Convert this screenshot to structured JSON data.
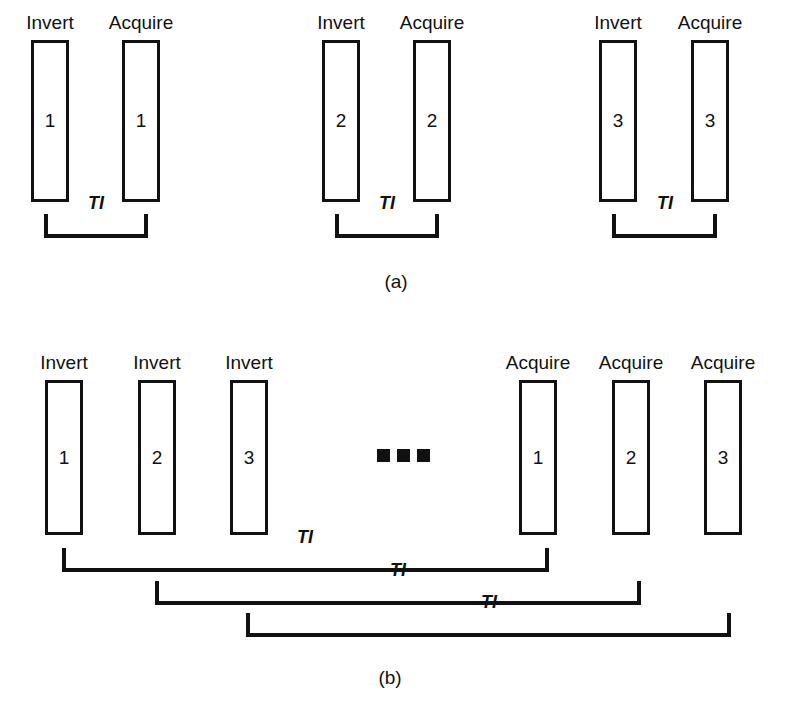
{
  "figure": {
    "ti_label": "TI",
    "panels": [
      {
        "caption": "(a)",
        "caption_x": 396,
        "caption_y": 272,
        "groups": [
          {
            "invert": {
              "label": "Invert",
              "number": "1",
              "x": 31,
              "y": 40,
              "w": 38,
              "h": 162
            },
            "acquire": {
              "label": "Acquire",
              "number": "1",
              "x": 122,
              "y": 40,
              "w": 38,
              "h": 162
            },
            "bracket": {
              "x": 44,
              "y": 214,
              "w": 104,
              "h": 24
            },
            "ti_x": 96,
            "ti_y": 212
          },
          {
            "invert": {
              "label": "Invert",
              "number": "2",
              "x": 322,
              "y": 40,
              "w": 38,
              "h": 162
            },
            "acquire": {
              "label": "Acquire",
              "number": "2",
              "x": 413,
              "y": 40,
              "w": 38,
              "h": 162
            },
            "bracket": {
              "x": 335,
              "y": 214,
              "w": 104,
              "h": 24
            },
            "ti_x": 387,
            "ti_y": 212
          },
          {
            "invert": {
              "label": "Invert",
              "number": "3",
              "x": 599,
              "y": 40,
              "w": 38,
              "h": 162
            },
            "acquire": {
              "label": "Acquire",
              "number": "3",
              "x": 691,
              "y": 40,
              "w": 38,
              "h": 162
            },
            "bracket": {
              "x": 612,
              "y": 214,
              "w": 105,
              "h": 24
            },
            "ti_x": 665,
            "ti_y": 212
          }
        ]
      },
      {
        "caption": "(b)",
        "caption_x": 390,
        "caption_y": 668,
        "invert_boxes": [
          {
            "label": "Invert",
            "number": "1",
            "x": 45,
            "y": 380,
            "w": 38,
            "h": 155
          },
          {
            "label": "Invert",
            "number": "2",
            "x": 138,
            "y": 380,
            "w": 38,
            "h": 155
          },
          {
            "label": "Invert",
            "number": "3",
            "x": 230,
            "y": 380,
            "w": 38,
            "h": 155
          }
        ],
        "acquire_boxes": [
          {
            "label": "Acquire",
            "number": "1",
            "x": 519,
            "y": 380,
            "w": 38,
            "h": 155
          },
          {
            "label": "Acquire",
            "number": "2",
            "x": 612,
            "y": 380,
            "w": 38,
            "h": 155
          },
          {
            "label": "Acquire",
            "number": "3",
            "x": 704,
            "y": 380,
            "w": 38,
            "h": 155
          }
        ],
        "ellipsis": {
          "x": 377,
          "y": 449,
          "count": 3
        },
        "brackets": [
          {
            "x": 62,
            "y": 548,
            "w": 487,
            "h": 24,
            "ti_x": 305,
            "ti_y": 546
          },
          {
            "x": 155,
            "y": 581,
            "w": 486,
            "h": 24,
            "ti_x": 398,
            "ti_y": 579
          },
          {
            "x": 246,
            "y": 613,
            "w": 485,
            "h": 24,
            "ti_x": 489,
            "ti_y": 611
          }
        ]
      }
    ]
  }
}
